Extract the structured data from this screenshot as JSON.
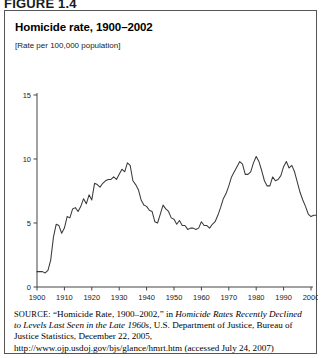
{
  "figure": {
    "label": "FIGURE 1.4"
  },
  "chart_header": {
    "title": "Homicide rate, 1900–2002",
    "subtitle": "[Rate per 100,000 population]"
  },
  "source": {
    "label": "SOURCE:",
    "text_part1": " “Homicide Rate, 1900–2002,” in ",
    "italic1": "Homicide Rates Recently Declined to Levels Last Seen in the Late 1960s",
    "text_part2": ", U.S. Department of Justice, Bureau of Justice Statistics, December 22, 2005, http://www.ojp.usdoj.gov/bjs/glance/hmrt.htm (accessed July 24, 2007)"
  },
  "chart_data": {
    "type": "line",
    "title": "Homicide rate, 1900–2002",
    "subtitle": "[Rate per 100,000 population]",
    "xlabel": "",
    "ylabel": "",
    "xlim": [
      1900,
      2002
    ],
    "ylim": [
      0,
      15
    ],
    "yticks": [
      0,
      5,
      10,
      15
    ],
    "ytick_labels": [
      "0",
      "5",
      "10",
      "15"
    ],
    "xticks": [
      1900,
      1910,
      1920,
      1930,
      1940,
      1950,
      1960,
      1970,
      1980,
      1990,
      2000
    ],
    "xtick_labels": [
      "1900",
      "1910",
      "1920",
      "1930",
      "1940",
      "1950",
      "1960",
      "1970",
      "1980",
      "1990",
      "2000"
    ],
    "grid": false,
    "legend": null,
    "line_color": "#3a3a3a",
    "series": [
      {
        "name": "Homicide rate per 100,000 population",
        "x": [
          1900,
          1901,
          1902,
          1903,
          1904,
          1905,
          1906,
          1907,
          1908,
          1909,
          1910,
          1911,
          1912,
          1913,
          1914,
          1915,
          1916,
          1917,
          1918,
          1919,
          1920,
          1921,
          1922,
          1923,
          1924,
          1925,
          1926,
          1927,
          1928,
          1929,
          1930,
          1931,
          1932,
          1933,
          1934,
          1935,
          1936,
          1937,
          1938,
          1939,
          1940,
          1941,
          1942,
          1943,
          1944,
          1945,
          1946,
          1947,
          1948,
          1949,
          1950,
          1951,
          1952,
          1953,
          1954,
          1955,
          1956,
          1957,
          1958,
          1959,
          1960,
          1961,
          1962,
          1963,
          1964,
          1965,
          1966,
          1967,
          1968,
          1969,
          1970,
          1971,
          1972,
          1973,
          1974,
          1975,
          1976,
          1977,
          1978,
          1979,
          1980,
          1981,
          1982,
          1983,
          1984,
          1985,
          1986,
          1987,
          1988,
          1989,
          1990,
          1991,
          1992,
          1993,
          1994,
          1995,
          1996,
          1997,
          1998,
          1999,
          2000,
          2001,
          2002
        ],
        "values": [
          1.2,
          1.2,
          1.2,
          1.1,
          1.3,
          2.1,
          3.9,
          4.9,
          4.8,
          4.2,
          4.6,
          5.5,
          5.4,
          6.1,
          6.2,
          5.9,
          6.3,
          6.9,
          6.5,
          7.2,
          6.8,
          8.1,
          8.0,
          7.8,
          8.1,
          8.3,
          8.4,
          8.4,
          8.6,
          8.4,
          8.8,
          9.2,
          9.0,
          9.7,
          9.5,
          8.3,
          8.0,
          7.6,
          6.8,
          6.4,
          6.3,
          6.0,
          5.9,
          5.1,
          5.0,
          5.7,
          6.4,
          6.1,
          5.9,
          5.4,
          5.3,
          4.9,
          5.2,
          4.8,
          4.8,
          4.5,
          4.6,
          4.6,
          4.5,
          4.6,
          5.1,
          4.8,
          4.8,
          4.6,
          4.9,
          5.1,
          5.6,
          6.2,
          6.9,
          7.3,
          7.9,
          8.6,
          9.0,
          9.4,
          9.8,
          9.6,
          8.8,
          8.8,
          9.0,
          9.7,
          10.2,
          9.8,
          9.1,
          8.3,
          7.9,
          7.9,
          8.6,
          8.3,
          8.4,
          8.7,
          9.4,
          9.8,
          9.3,
          9.5,
          9.0,
          8.2,
          7.4,
          6.8,
          6.3,
          5.7,
          5.5,
          5.6,
          5.6
        ]
      }
    ]
  },
  "axis": {
    "y_tick_0": "0",
    "y_tick_5": "5",
    "y_tick_10": "10",
    "y_tick_15": "15"
  }
}
